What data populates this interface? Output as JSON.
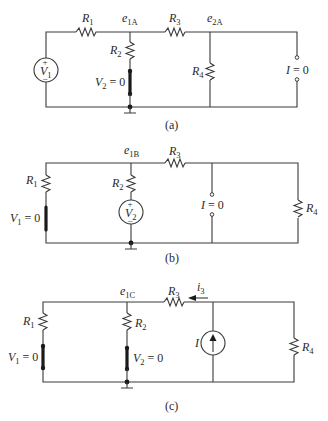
{
  "figure": {
    "panels": [
      {
        "id": "a",
        "caption": "(a)",
        "labels": {
          "R1": "R",
          "R1_sub": "1",
          "e": "e",
          "e_sub": "1A",
          "R2": "R",
          "R2_sub": "2",
          "V2eq_pre": "V",
          "V2eq_sub": "2",
          "V2eq_post": " = 0",
          "R3": "R",
          "R3_sub": "3",
          "e2": "e",
          "e2_sub": "2A",
          "R4": "R",
          "R4_sub": "4",
          "I": "I",
          "I_post": " = 0",
          "V1": "V",
          "V1_sub": "1",
          "plus": "+",
          "minus": "−"
        }
      },
      {
        "id": "b",
        "caption": "(b)",
        "labels": {
          "e": "e",
          "e_sub": "1B",
          "R3": "R",
          "R3_sub": "3",
          "R1": "R",
          "R1_sub": "1",
          "R2": "R",
          "R2_sub": "2",
          "V1eq_pre": "V",
          "V1eq_sub": "1",
          "V1eq_post": " = 0",
          "V2": "V",
          "V2_sub": "2",
          "I": "I",
          "I_post": " = 0",
          "R4": "R",
          "R4_sub": "4",
          "plus": "+",
          "minus": "−"
        }
      },
      {
        "id": "c",
        "caption": "(c)",
        "labels": {
          "e": "e",
          "e_sub": "1C",
          "R3": "R",
          "R3_sub": "3",
          "i3": "i",
          "i3_sub": "3",
          "R1": "R",
          "R1_sub": "1",
          "R2": "R",
          "R2_sub": "2",
          "V1eq_pre": "V",
          "V1eq_sub": "1",
          "V1eq_post": " = 0",
          "V2eq_pre": "V",
          "V2eq_sub": "2",
          "V2eq_post": " = 0",
          "I": "I",
          "R4": "R",
          "R4_sub": "4"
        }
      }
    ]
  }
}
